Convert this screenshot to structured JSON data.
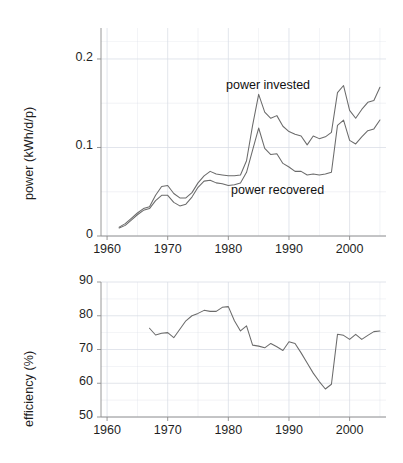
{
  "figure": {
    "background": "#ffffff",
    "line_color": "#6b6b6b",
    "grid_color": "#d9dde6",
    "axis_color": "#8d8d8d",
    "text_color": "#1f1f1f"
  },
  "panels": {
    "top": {
      "ylabel": "power (kWh/d/p)",
      "yticks": [
        "0",
        "0.1",
        "0.2"
      ],
      "xticks": [
        "1960",
        "1970",
        "1980",
        "1990",
        "2000"
      ],
      "annotations": [
        {
          "name": "power-invested-label",
          "text": "power invested"
        },
        {
          "name": "power-recovered-label",
          "text": "power recovered"
        }
      ]
    },
    "bottom": {
      "ylabel": "efficiency (%)",
      "yticks": [
        "50",
        "60",
        "70",
        "80",
        "90"
      ],
      "xticks": [
        "1960",
        "1970",
        "1980",
        "1990",
        "2000"
      ]
    }
  },
  "chart_data": [
    {
      "type": "line",
      "name": "power-panel",
      "title": "",
      "xlabel": "",
      "ylabel": "power (kWh/d/p)",
      "xlim": [
        1959,
        2006
      ],
      "ylim": [
        0,
        0.235
      ],
      "xticks": [
        1960,
        1970,
        1980,
        1990,
        2000
      ],
      "yticks": [
        0,
        0.1,
        0.2
      ],
      "grid": true,
      "legend": "inline-annotations",
      "x": [
        1962,
        1963,
        1964,
        1965,
        1966,
        1967,
        1968,
        1969,
        1970,
        1971,
        1972,
        1973,
        1974,
        1975,
        1976,
        1977,
        1978,
        1979,
        1980,
        1981,
        1982,
        1983,
        1984,
        1985,
        1986,
        1987,
        1988,
        1989,
        1990,
        1991,
        1992,
        1993,
        1994,
        1995,
        1996,
        1997,
        1998,
        1999,
        2000,
        2001,
        2002,
        2003,
        2004,
        2005
      ],
      "series": [
        {
          "name": "power invested",
          "values": [
            0.01,
            0.014,
            0.02,
            0.026,
            0.031,
            0.033,
            0.046,
            0.056,
            0.057,
            0.048,
            0.043,
            0.043,
            0.049,
            0.06,
            0.068,
            0.073,
            0.07,
            0.069,
            0.068,
            0.068,
            0.069,
            0.085,
            0.125,
            0.16,
            0.14,
            0.133,
            0.136,
            0.124,
            0.118,
            0.115,
            0.113,
            0.103,
            0.113,
            0.11,
            0.112,
            0.117,
            0.162,
            0.17,
            0.142,
            0.133,
            0.143,
            0.151,
            0.153,
            0.168,
            0.222
          ]
        },
        {
          "name": "power recovered",
          "values": [
            0.009,
            0.012,
            0.018,
            0.024,
            0.029,
            0.031,
            0.04,
            0.046,
            0.046,
            0.038,
            0.034,
            0.036,
            0.044,
            0.055,
            0.062,
            0.063,
            0.06,
            0.059,
            0.057,
            0.058,
            0.06,
            0.072,
            0.097,
            0.122,
            0.099,
            0.092,
            0.093,
            0.082,
            0.078,
            0.073,
            0.073,
            0.069,
            0.07,
            0.069,
            0.07,
            0.072,
            0.125,
            0.131,
            0.108,
            0.104,
            0.112,
            0.119,
            0.121,
            0.131,
            0.17
          ]
        }
      ]
    },
    {
      "type": "line",
      "name": "efficiency-panel",
      "title": "",
      "xlabel": "",
      "ylabel": "efficiency (%)",
      "xlim": [
        1959,
        2006
      ],
      "ylim": [
        50,
        90
      ],
      "xticks": [
        1960,
        1970,
        1980,
        1990,
        2000
      ],
      "yticks": [
        50,
        60,
        70,
        80,
        90
      ],
      "grid": true,
      "x": [
        1967,
        1968,
        1969,
        1970,
        1971,
        1972,
        1973,
        1974,
        1975,
        1976,
        1977,
        1978,
        1979,
        1980,
        1981,
        1982,
        1983,
        1984,
        1985,
        1986,
        1987,
        1988,
        1989,
        1990,
        1991,
        1992,
        1993,
        1994,
        1995,
        1996,
        1997,
        1998,
        1999,
        2000,
        2001,
        2002,
        2003,
        2004,
        2005
      ],
      "series": [
        {
          "name": "efficiency",
          "values": [
            76.3,
            74.3,
            74.8,
            75.0,
            73.5,
            76.0,
            78.5,
            80.0,
            80.7,
            81.6,
            81.3,
            81.3,
            82.5,
            82.7,
            78.5,
            75.5,
            77.0,
            71.3,
            71.0,
            70.5,
            71.8,
            70.8,
            69.7,
            72.3,
            71.8,
            69.0,
            66.0,
            63.0,
            60.5,
            58.3,
            59.7,
            74.5,
            74.2,
            73.0,
            74.5,
            73.0,
            74.2,
            75.3,
            75.5
          ]
        }
      ]
    }
  ]
}
